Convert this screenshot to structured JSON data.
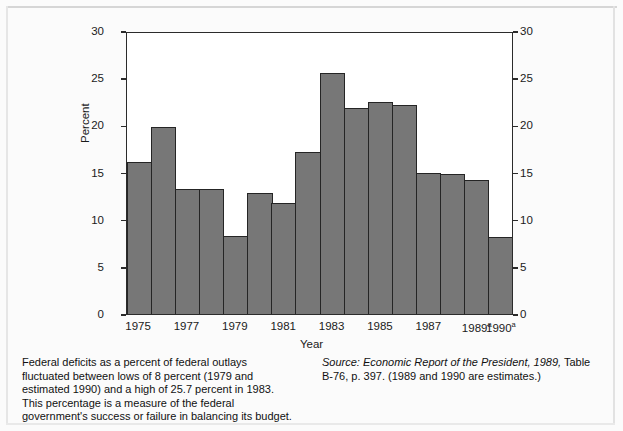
{
  "figure": {
    "ylabel": "Percent",
    "xlabel": "Year",
    "caption_left": "Federal deficits as a percent of federal outlays fluctuated between lows of 8 percent (1979 and estimated 1990) and a high of 25.7 percent in 1983. This percentage is a measure of the federal government's success or failure in balancing its budget.",
    "source_italic": "Source: Economic Report of the President, 1989,",
    "source_rest": " Table B-76, p. 397. (1989 and 1990 are estimates.)",
    "bar_color": "#777777",
    "bar_edge_color": "#252525",
    "axis_color": "#2b2b2b"
  },
  "chart_data": {
    "type": "bar",
    "title": "",
    "xlabel": "Year",
    "ylabel": "Percent",
    "ylim": [
      0,
      30
    ],
    "yticks": [
      0,
      5,
      10,
      15,
      20,
      25,
      30
    ],
    "ytick_labels": [
      "0",
      "5",
      "10",
      "15",
      "20",
      "25",
      "30"
    ],
    "right_axis": true,
    "right_ytick_labels": [
      "0",
      "5",
      "10",
      "15",
      "20",
      "25",
      "30"
    ],
    "grid": false,
    "legend": "none",
    "categories": [
      "1975",
      "1976",
      "1977",
      "1978",
      "1979",
      "1980",
      "1981",
      "1982",
      "1983",
      "1984",
      "1985",
      "1986",
      "1987",
      "1988",
      "1989",
      "1990"
    ],
    "xtick_labels": [
      "1975",
      "1977",
      "1979",
      "1981",
      "1983",
      "1985",
      "1987",
      "1989",
      "1990"
    ],
    "xtick_superscripts": [
      "",
      "",
      "",
      "",
      "",
      "",
      "",
      "a",
      "a"
    ],
    "xtick_categories": [
      "1975",
      "1977",
      "1979",
      "1981",
      "1983",
      "1985",
      "1987",
      "1989",
      "1990"
    ],
    "values": [
      16.2,
      20.0,
      13.4,
      13.3,
      8.3,
      12.9,
      11.9,
      17.3,
      25.7,
      22.0,
      22.6,
      22.3,
      15.1,
      14.9,
      14.3,
      8.2
    ],
    "annotations": [
      "1989 and 1990 are estimates (superscript a)"
    ]
  }
}
